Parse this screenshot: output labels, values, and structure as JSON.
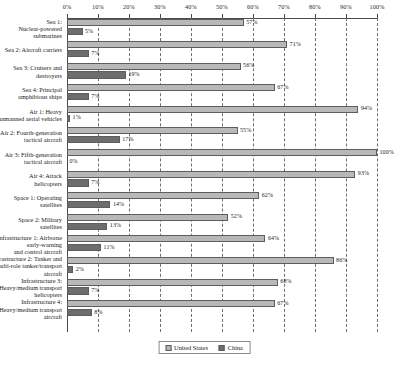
{
  "chart_data": {
    "type": "bar",
    "orientation": "horizontal",
    "title": "",
    "xlabel": "",
    "ylabel": "",
    "xlim": [
      0,
      100
    ],
    "grid": true,
    "grid_axis": "x",
    "legend_position": "bottom-center",
    "axis_position": "top",
    "value_suffix": "%",
    "tick_labels": [
      "0%",
      "10%",
      "20%",
      "30%",
      "40%",
      "50%",
      "60%",
      "70%",
      "80%",
      "90%",
      "100%"
    ],
    "tick_values": [
      0,
      10,
      20,
      30,
      40,
      50,
      60,
      70,
      80,
      90,
      100
    ],
    "categories": [
      "Sea 1:\nNuclear-powered\nsubmarines",
      "Sea 2: Aircraft carriers",
      "Sea 3: Cruisers and\ndestroyers",
      "Sea 4: Principal\namphibious ships",
      "Air 1: Heavy\nunmanned aerial vehicles",
      "Air 2: Fourth-generation\ntactical aircraft",
      "Air 3: Fifth-generation\ntactical aircraft",
      "Air 4: Attack\nhelicopters",
      "Space 1: Operating\nsatellites",
      "Space 2: Military\nsatellites",
      "Infrastructure 1: Airborne\nearly-warning\nand control aircraft",
      "Infrastructure 2: Tanker and\nmulti-role tanker/transport\naircraft",
      "Infrastructure 3:\nHeavy/medium transport\nhelicopters",
      "Infrastructure 4:\nHeavy/medium transport\naircraft"
    ],
    "series": [
      {
        "name": "United States",
        "color": "#b8b8b8",
        "values": [
          57,
          71,
          56,
          67,
          94,
          55,
          100,
          93,
          62,
          52,
          64,
          86,
          68,
          67
        ],
        "labels": [
          "57%",
          "71%",
          "56%",
          "67%",
          "94%",
          "55%",
          "100%",
          "93%",
          "62%",
          "52%",
          "64%",
          "86%",
          "68%",
          "67%"
        ]
      },
      {
        "name": "China",
        "color": "#6d6d6d",
        "values": [
          5,
          7,
          19,
          7,
          1,
          17,
          0,
          7,
          14,
          13,
          11,
          2,
          7,
          8
        ],
        "labels": [
          "5%",
          "7%",
          "19%",
          "7%",
          "1%",
          "17%",
          "0%",
          "7%",
          "14%",
          "13%",
          "11%",
          "2%",
          "7%",
          "8%"
        ]
      }
    ]
  },
  "legend": {
    "items": [
      {
        "label": "United States",
        "color": "#b8b8b8"
      },
      {
        "label": "China",
        "color": "#6d6d6d"
      }
    ]
  }
}
